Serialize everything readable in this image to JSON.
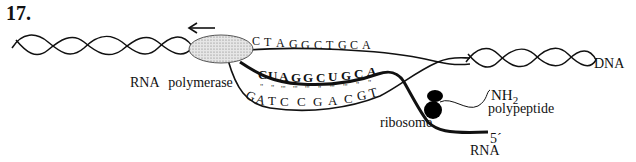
{
  "figure": {
    "question_number": "17."
  },
  "labels": {
    "rna_polymerase": "RNA polymerase",
    "dna": "DNA",
    "nh2_main": "NH",
    "nh2_sub": "2",
    "polypeptide": "polypeptide",
    "ribosome": "ribosome",
    "five_prime": "5´",
    "rna": "RNA"
  },
  "sequences": {
    "coding_strand": [
      "C",
      "T",
      "A",
      "G",
      "G",
      "C",
      "T",
      "G",
      "C",
      "A"
    ],
    "rna_transcript": [
      "C",
      "U",
      "A",
      "G",
      "G",
      "C",
      "U",
      "G",
      "C",
      "A"
    ],
    "template_strand": [
      "G",
      "A",
      "T",
      "C",
      "C",
      "G",
      "A",
      "C",
      "G",
      "T"
    ],
    "base_pair_bonds": [
      "\"",
      "\"",
      "'''",
      "'''",
      "'''",
      "\"",
      "'''",
      "'''",
      "\"",
      "\""
    ]
  },
  "annotations": {
    "direction_arrow": "leftward",
    "colors": {
      "ink": "#111111",
      "polymerase_fill": "#d9d9d9",
      "ribosome_fill": "#000000",
      "background": "#ffffff"
    }
  }
}
